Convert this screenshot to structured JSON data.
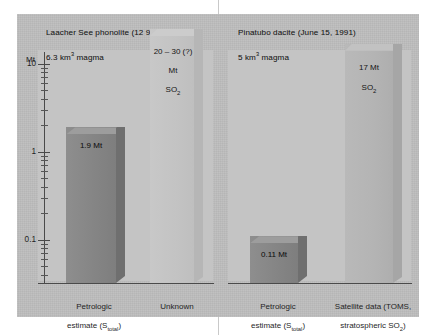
{
  "figure": {
    "axis_unit": "Mt",
    "axis_ticks": [
      "10",
      "1",
      "0.1"
    ]
  },
  "panels": [
    {
      "title_line1": "Laacher See phonolite (12 900 B.P.)",
      "title_line2_pre": "6.3 km",
      "title_line2_sup": "3",
      "title_line2_post": " magma"
    },
    {
      "title_line1": "Pinatubo dacite (June 15, 1991)",
      "title_line2_pre": "5 km",
      "title_line2_sup": "3",
      "title_line2_post": " magma"
    }
  ],
  "bars": {
    "laacher_petrologic": {
      "value_label": "1.9 Mt",
      "category_line1": "Petrologic",
      "category_line2_pre": "estimate (S",
      "category_line2_sub": "total",
      "category_line2_post": ")"
    },
    "laacher_unknown": {
      "value_label_line1": "20 – 30 (?)",
      "value_label_line2": "Mt",
      "value_label_line3_pre": "SO",
      "value_label_line3_sub": "2",
      "category_line1": "Unknown"
    },
    "pinatubo_petrologic": {
      "value_label": "0.11 Mt",
      "category_line1": "Petrologic",
      "category_line2_pre": "estimate (S",
      "category_line2_sub": "total",
      "category_line2_post": ")"
    },
    "pinatubo_satellite": {
      "value_label_line1": "17 Mt",
      "value_label_line2_pre": "SO",
      "value_label_line2_sub": "2",
      "category_line1_pre": "Satellite data (TOMS,",
      "category_line2_pre": "stratospheric SO",
      "category_line2_sub": "2",
      "category_line2_post": ")"
    }
  },
  "chart_data": {
    "type": "bar",
    "subtitle": "Laacher See phonolite (12 900 B.P.) vs Pinatubo dacite (June 15, 1991)",
    "xlabel": "",
    "ylabel": "Mt",
    "yscale": "log",
    "ylim": [
      0.03,
      30
    ],
    "yticks": [
      0.1,
      1,
      10
    ],
    "ytick_labels": [
      "0.1",
      "1",
      "10"
    ],
    "grid": false,
    "legend": false,
    "panels": [
      {
        "name": "Laacher See phonolite (12 900 B.P.)",
        "magma_volume_km3": 6.3,
        "categories": [
          "Petrologic estimate (Stotal)",
          "Unknown"
        ],
        "values": [
          1.9,
          25
        ],
        "value_labels": [
          "1.9 Mt",
          "20 – 30 (?) Mt SO2"
        ],
        "uncertain": [
          false,
          true
        ]
      },
      {
        "name": "Pinatubo dacite (June 15, 1991)",
        "magma_volume_km3": 5,
        "categories": [
          "Petrologic estimate (Stotal)",
          "Satellite data (TOMS, stratospheric SO2)"
        ],
        "values": [
          0.11,
          17
        ],
        "value_labels": [
          "0.11 Mt",
          "17 Mt SO2"
        ],
        "uncertain": [
          false,
          false
        ]
      }
    ],
    "units": "Mt SO2"
  },
  "colors": {
    "canvas": "#bdbdbd",
    "plot_bg": "#c4c4c4",
    "bar_dark": "#858585",
    "bar_light": "#b4b4b4",
    "bar_ghost": "#c3c3c3",
    "axis": "#4a4a4a",
    "text": "#1f1f1f"
  }
}
